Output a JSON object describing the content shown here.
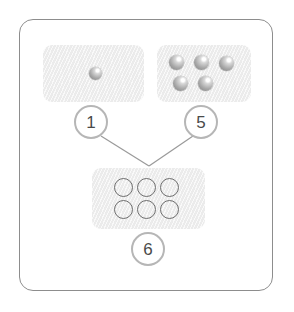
{
  "diagram": {
    "frame": {
      "name": "outer-frame",
      "border_color": "#8d8d8d"
    },
    "colors": {
      "panel_fill": "#eeeeee",
      "sphere_gray": "#a9a9a9",
      "ring_outline": "#6e6e6e",
      "badge_ring": "#b6b6b6",
      "badge_text": "#4a4a4a",
      "connector_line": "#9a9a9a"
    },
    "panels": [
      {
        "id": "reactant-1",
        "badge_label": "1",
        "item_type": "sphere",
        "item_count": 1,
        "items": [
          {
            "name": "sphere",
            "x": 46,
            "y": 22
          }
        ]
      },
      {
        "id": "reactant-2",
        "badge_label": "5",
        "item_type": "sphere",
        "item_count": 5,
        "items": [
          {
            "name": "sphere",
            "x": 12,
            "y": 10
          },
          {
            "name": "sphere",
            "x": 37,
            "y": 10
          },
          {
            "name": "sphere",
            "x": 62,
            "y": 11
          },
          {
            "name": "sphere",
            "x": 16,
            "y": 31
          },
          {
            "name": "sphere",
            "x": 41,
            "y": 31
          }
        ]
      },
      {
        "id": "product",
        "badge_label": "6",
        "item_type": "ring",
        "item_count": 6,
        "items": [
          {
            "name": "ring",
            "x": 22,
            "y": 10
          },
          {
            "name": "ring",
            "x": 45,
            "y": 10
          },
          {
            "name": "ring",
            "x": 68,
            "y": 10
          },
          {
            "name": "ring",
            "x": 22,
            "y": 32
          },
          {
            "name": "ring",
            "x": 45,
            "y": 32
          },
          {
            "name": "ring",
            "x": 68,
            "y": 32
          }
        ]
      }
    ],
    "badges": [
      {
        "name": "badge-1",
        "label": "1"
      },
      {
        "name": "badge-5",
        "label": "5"
      },
      {
        "name": "badge-6",
        "label": "6"
      }
    ],
    "connectors": [
      {
        "name": "connector-1-to-product",
        "from": "badge-1",
        "to": "product-apex"
      },
      {
        "name": "connector-5-to-product",
        "from": "badge-5",
        "to": "product-apex"
      }
    ]
  }
}
